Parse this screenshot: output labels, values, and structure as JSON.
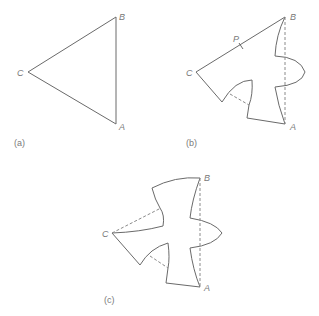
{
  "figure": {
    "panels": [
      {
        "id": "a",
        "caption": "(a)",
        "vertices": {
          "A": "A",
          "B": "B",
          "C": "C"
        },
        "description": "Equilateral triangle ABC"
      },
      {
        "id": "b",
        "caption": "(b)",
        "vertices": {
          "A": "A",
          "B": "B",
          "C": "C"
        },
        "point_label": "P",
        "description": "Triangle with sides AB and CA modified by curved cut-outs; dashed lines show original edges"
      },
      {
        "id": "c",
        "caption": "(c)",
        "vertices": {
          "A": "A",
          "B": "B",
          "C": "C"
        },
        "description": "All three sides modified into a tessellating bird-like shape; dashed lines show original triangle edges"
      }
    ]
  }
}
